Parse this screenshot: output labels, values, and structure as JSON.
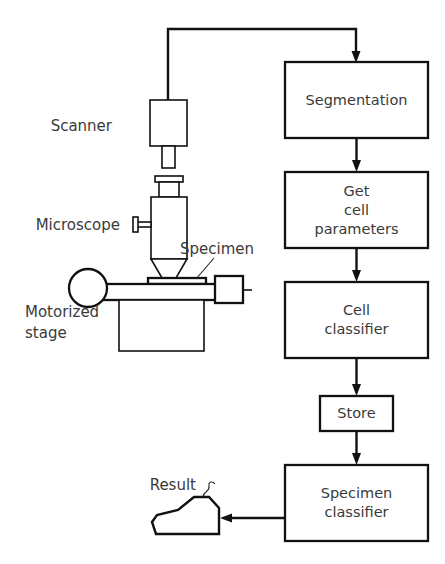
{
  "figure": {
    "type": "block-diagram",
    "background_color": "#ffffff",
    "line_color": "#111111",
    "text_color": "#3a3a3a"
  },
  "apparatus": {
    "labels": {
      "scanner": "Scanner",
      "microscope": "Microscope",
      "specimen": "Specimen",
      "motorized_stage_line1": "Motorized",
      "motorized_stage_line2": "stage"
    }
  },
  "pipeline": {
    "boxes": [
      {
        "id": "segmentation",
        "lines": [
          "Segmentation"
        ]
      },
      {
        "id": "get-cell-parameters",
        "lines": [
          "Get",
          "cell",
          "parameters"
        ]
      },
      {
        "id": "cell-classifier",
        "lines": [
          "Cell",
          "classifier"
        ]
      },
      {
        "id": "store",
        "lines": [
          "Store"
        ]
      },
      {
        "id": "specimen-classifier",
        "lines": [
          "Specimen",
          "classifier"
        ]
      }
    ]
  },
  "output": {
    "label": "Result"
  }
}
